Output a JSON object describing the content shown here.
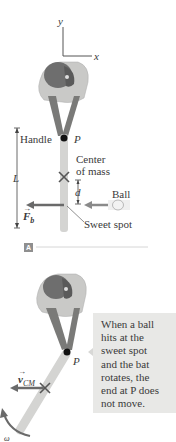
{
  "panel_a": {
    "axes": {
      "y_label": "y",
      "x_label": "x"
    },
    "labels": {
      "handle": "Handle",
      "pivot": "P",
      "center_of_mass_line1": "Center",
      "center_of_mass_line2": "of mass",
      "length": "L",
      "distance": "d",
      "ball": "Ball",
      "force": "F",
      "force_sub": "b",
      "sweet_spot": "Sweet spot"
    },
    "badge": "A"
  },
  "panel_b": {
    "labels": {
      "pivot": "P",
      "velocity": "v",
      "velocity_sub": "CM",
      "omega": "ω"
    },
    "callout_lines": [
      "When a ball",
      "hits at the",
      "sweet spot",
      "and the bat",
      "rotates, the",
      "end at P does",
      "not move."
    ]
  },
  "colors": {
    "bat": "#d4d4d2",
    "shirt": "#c9c9c7",
    "cap": "#6e6e6e",
    "skin": "#7a7a78",
    "arrow": "#6a6a6a",
    "callout_bg": "#e8e8e6",
    "badge_bg": "#8f8f8f"
  }
}
